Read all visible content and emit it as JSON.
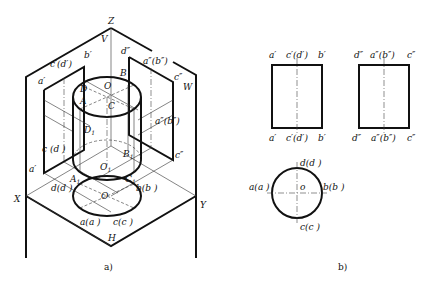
{
  "figure_a": {
    "caption": "a)",
    "axes": {
      "Z": "Z",
      "X": "X",
      "Y": "Y"
    },
    "planes": {
      "V": "V",
      "W": "W",
      "H": "H"
    },
    "space_points": {
      "O": "O",
      "A": "A",
      "B": "B",
      "C": "C",
      "D": "D",
      "O1": "O",
      "A1": "A",
      "B1": "B",
      "C1": "C",
      "D1": "D",
      "sub1": "1"
    },
    "v_projection_labels": {
      "a_prime": "a′",
      "b_prime": "b′",
      "c_d_prime": "c′(d′)",
      "a1_prime": "a′",
      "c1_d1_prime": "c (d )"
    },
    "w_projection_labels": {
      "d_dprime": "d″",
      "a_b_dprime": "a″(b″)",
      "c_dprime": "c″",
      "a1_b1_dprime": "a″(b″)",
      "c1_dprime": "c″"
    },
    "h_projection_labels": {
      "a_a1": "a(a )",
      "b_b1": "b(b )",
      "c_c1": "c(c )",
      "d_d1": "d(d )",
      "o": "O"
    }
  },
  "figure_b": {
    "caption": "b)",
    "front_view": {
      "top_labels": [
        "a′",
        "c′(d′)",
        "b′"
      ],
      "bottom_labels": [
        "a′",
        "c′(d′)",
        "b′"
      ]
    },
    "side_view": {
      "top_labels": [
        "d″",
        "a″(b″)",
        "c″"
      ],
      "bottom_labels": [
        "d″",
        "a″(b″)",
        "c″"
      ]
    },
    "top_view": {
      "labels": {
        "d": "d(d )",
        "a": "a(a )",
        "b": "b(b )",
        "c": "c(c )",
        "o": "o"
      }
    }
  }
}
